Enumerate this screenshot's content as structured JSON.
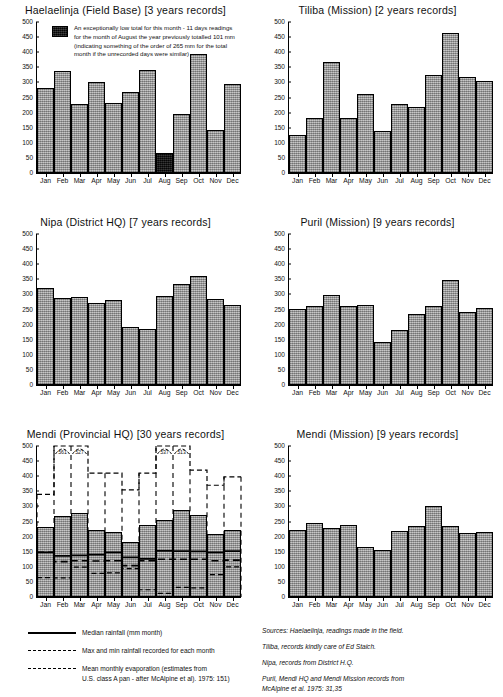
{
  "figure": {
    "ylim": [
      0,
      500
    ],
    "yticks": [
      0,
      50,
      100,
      150,
      200,
      250,
      300,
      350,
      400,
      450,
      500
    ],
    "months": [
      "Jan",
      "Feb",
      "Mar",
      "Apr",
      "May",
      "Jun",
      "Jul",
      "Aug",
      "Sep",
      "Oct",
      "Nov",
      "Dec"
    ]
  },
  "annotation": {
    "text": "An exceptionally low total for this month - 11 days readings for the month of August the year previously totalled 101 mm (indicating something of the order of 265 mm for the total month if the unrecorded days were similar)"
  },
  "legend": {
    "items": [
      {
        "key": "solid",
        "label": "Median rainfall (mm month)"
      },
      {
        "key": "dashed-fine",
        "label": "Max and min rainfall recorded for each month"
      },
      {
        "key": "dashed-long",
        "label": "Mean monthly evaporation (estimates from\nU.S. class A pan - after McAlpine et al). 1975: 151)"
      }
    ]
  },
  "sources": {
    "lines": [
      "Sources: Haelaelinja, readings made in  the field.",
      "Tiliba, records kindly care of Ed Staich.",
      "Nipa, records from District H.Q.",
      "Puril, Mendi HQ and Mendi Mission records from\nMcAlpine et al. 1975: 31,35"
    ]
  },
  "chart_data": [
    {
      "type": "bar",
      "title": "Haelaelinja (Field Base) [3 years records]",
      "xlabel": "",
      "ylabel": "",
      "ylim": [
        0,
        500
      ],
      "grid": false,
      "categories": [
        "Jan",
        "Feb",
        "Mar",
        "Apr",
        "May",
        "Jun",
        "Jul",
        "Aug",
        "Sep",
        "Oct",
        "Nov",
        "Dec"
      ],
      "values": [
        283,
        338,
        228,
        302,
        232,
        268,
        342,
        66,
        195,
        394,
        144,
        294
      ],
      "highlight_index": 7,
      "highlight_note": "Aug bar shown in black - incomplete record"
    },
    {
      "type": "bar",
      "title": "Tiliba (Mission) [2 years records]",
      "xlabel": "",
      "ylabel": "",
      "ylim": [
        0,
        500
      ],
      "grid": false,
      "categories": [
        "Jan",
        "Feb",
        "Mar",
        "Apr",
        "May",
        "Jun",
        "Jul",
        "Aug",
        "Sep",
        "Oct",
        "Nov",
        "Dec"
      ],
      "values": [
        125,
        183,
        369,
        183,
        261,
        140,
        230,
        217,
        323,
        462,
        317,
        306
      ]
    },
    {
      "type": "bar",
      "title": "Nipa (District HQ) [7 years records]",
      "xlabel": "",
      "ylabel": "",
      "ylim": [
        0,
        500
      ],
      "grid": false,
      "categories": [
        "Jan",
        "Feb",
        "Mar",
        "Apr",
        "May",
        "Jun",
        "Jul",
        "Aug",
        "Sep",
        "Oct",
        "Nov",
        "Dec"
      ],
      "values": [
        322,
        288,
        292,
        272,
        283,
        193,
        185,
        294,
        336,
        360,
        284,
        265
      ]
    },
    {
      "type": "bar",
      "title": "Puril (Mission) [9 years records]",
      "xlabel": "",
      "ylabel": "",
      "ylim": [
        0,
        500
      ],
      "grid": false,
      "categories": [
        "Jan",
        "Feb",
        "Mar",
        "Apr",
        "May",
        "Jun",
        "Jul",
        "Aug",
        "Sep",
        "Oct",
        "Nov",
        "Dec"
      ],
      "values": [
        252,
        261,
        298,
        263,
        266,
        142,
        181,
        236,
        261,
        349,
        242,
        254
      ]
    },
    {
      "type": "bar",
      "title": "Mendi (Provincial HQ) [30 years records]",
      "xlabel": "",
      "ylabel": "",
      "ylim": [
        0,
        500
      ],
      "grid": false,
      "categories": [
        "Jan",
        "Feb",
        "Mar",
        "Apr",
        "May",
        "Jun",
        "Jul",
        "Aug",
        "Sep",
        "Oct",
        "Nov",
        "Dec"
      ],
      "values": [
        231,
        267,
        278,
        223,
        214,
        183,
        240,
        254,
        287,
        271,
        208,
        223
      ],
      "series": [
        {
          "name": "Median rainfall",
          "style": "solid",
          "values": [
            148,
            136,
            138,
            140,
            148,
            131,
            126,
            153,
            152,
            151,
            148,
            152
          ]
        },
        {
          "name": "Max rainfall recorded",
          "style": "dashed-fine",
          "values": [
            340,
            561,
            527,
            410,
            410,
            355,
            410,
            537,
            513,
            420,
            370,
            398
          ],
          "offscale_labels": {
            "1": "561",
            "2": "527",
            "7": "537",
            "8": "513"
          }
        },
        {
          "name": "Min rainfall recorded",
          "style": "dashed-fine",
          "values": [
            64,
            63,
            99,
            78,
            80,
            94,
            24,
            12,
            32,
            30,
            74,
            100
          ]
        },
        {
          "name": "Mean monthly evaporation",
          "style": "dashed-long",
          "values": [
            148,
            117,
            120,
            119,
            120,
            104,
            120,
            125,
            125,
            125,
            120,
            122
          ]
        }
      ]
    },
    {
      "type": "bar",
      "title": "Mendi (Mission) [9 years records]",
      "xlabel": "",
      "ylabel": "",
      "ylim": [
        0,
        500
      ],
      "grid": false,
      "categories": [
        "Jan",
        "Feb",
        "Mar",
        "Apr",
        "May",
        "Jun",
        "Jul",
        "Aug",
        "Sep",
        "Oct",
        "Nov",
        "Dec"
      ],
      "values": [
        221,
        245,
        228,
        238,
        167,
        156,
        217,
        235,
        303,
        235,
        211,
        216
      ]
    }
  ]
}
